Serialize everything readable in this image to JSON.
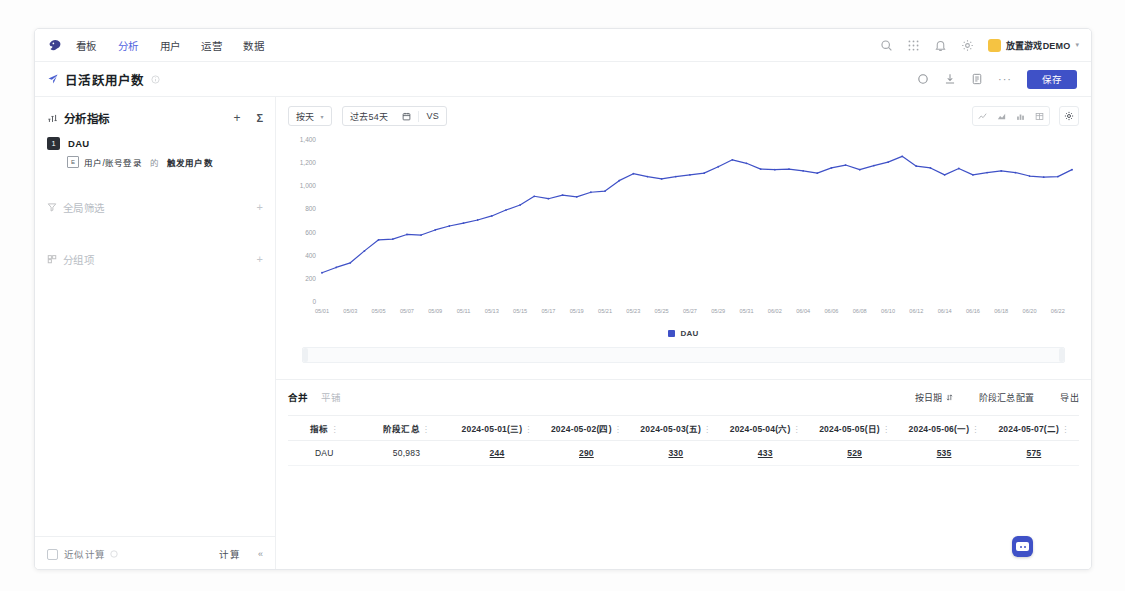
{
  "nav": {
    "logo_icon": "bird-logo-icon",
    "items": [
      {
        "label": "看板",
        "active": false
      },
      {
        "label": "分析",
        "active": true
      },
      {
        "label": "用户",
        "active": false
      },
      {
        "label": "运营",
        "active": false
      },
      {
        "label": "数据",
        "active": false
      }
    ],
    "icons": [
      "search-icon",
      "apps-grid-icon",
      "bell-icon",
      "settings-gear-icon"
    ],
    "account": {
      "name": "放置游戏DEMO",
      "caret": "▾"
    }
  },
  "titlebar": {
    "title": "日活跃用户数",
    "info_icon": "info-circle-icon",
    "actions": [
      "refresh-icon",
      "download-icon",
      "copy-icon"
    ],
    "more": "···",
    "save_label": "保存"
  },
  "left_panel": {
    "heading": "分析指标",
    "add_label": "+",
    "sigma_label": "Σ",
    "metric": {
      "index": "1",
      "name": "DAU",
      "def_icon": "E",
      "event": "用户/账号登录",
      "of": "的",
      "aggregation": "触发用户数"
    },
    "sections": [
      {
        "label": "全局筛选",
        "plus": "+"
      },
      {
        "label": "分组项",
        "plus": "+"
      }
    ],
    "footer": {
      "approx_label": "近似计算",
      "help_icon": "question-circle-icon",
      "calc_label": "计算",
      "collapse_label": "«"
    }
  },
  "toolbar": {
    "granularity": "按天",
    "granularity_caret": "▾",
    "range": "过去54天",
    "calendar_icon": "calendar-icon",
    "vs_label": "VS",
    "chart_types": [
      "line-chart-icon",
      "area-chart-icon",
      "bar-chart-icon",
      "table-icon"
    ],
    "settings_icon": "settings-gear-icon"
  },
  "chart_data": {
    "type": "line",
    "title": "日活跃用户数",
    "xlabel": "",
    "ylabel": "",
    "ylim": [
      0,
      1400
    ],
    "yticks": [
      0,
      200,
      400,
      600,
      800,
      1000,
      1200,
      1400
    ],
    "ytick_labels": [
      "0",
      "200",
      "400",
      "600",
      "800",
      "1,000",
      "1,200",
      "1,400"
    ],
    "grid": false,
    "legend_position": "bottom",
    "legend": [
      "DAU"
    ],
    "color": "#3f51c7",
    "xtick_labels": [
      "05/01",
      "05/03",
      "05/05",
      "05/07",
      "05/09",
      "05/11",
      "05/13",
      "05/15",
      "05/17",
      "05/19",
      "05/21",
      "05/23",
      "05/25",
      "05/27",
      "05/29",
      "05/31",
      "06/02",
      "06/04",
      "06/06",
      "06/08",
      "06/10",
      "06/12",
      "06/14",
      "06/16",
      "06/18",
      "06/20",
      "06/22"
    ],
    "x": [
      "05/01",
      "05/02",
      "05/03",
      "05/04",
      "05/05",
      "05/06",
      "05/07",
      "05/08",
      "05/09",
      "05/10",
      "05/11",
      "05/12",
      "05/13",
      "05/14",
      "05/15",
      "05/16",
      "05/17",
      "05/18",
      "05/19",
      "05/20",
      "05/21",
      "05/22",
      "05/23",
      "05/24",
      "05/25",
      "05/26",
      "05/27",
      "05/28",
      "05/29",
      "05/30",
      "05/31",
      "06/01",
      "06/02",
      "06/03",
      "06/04",
      "06/05",
      "06/06",
      "06/07",
      "06/08",
      "06/09",
      "06/10",
      "06/11",
      "06/12",
      "06/13",
      "06/14",
      "06/15",
      "06/16",
      "06/17",
      "06/18",
      "06/19",
      "06/20",
      "06/21",
      "06/22",
      "06/23"
    ],
    "series": [
      {
        "name": "DAU",
        "values": [
          244,
          290,
          330,
          433,
          529,
          535,
          575,
          570,
          614,
          648,
          673,
          700,
          735,
          786,
          830,
          905,
          884,
          915,
          900,
          940,
          950,
          1040,
          1100,
          1075,
          1055,
          1075,
          1090,
          1105,
          1160,
          1220,
          1190,
          1140,
          1135,
          1140,
          1125,
          1105,
          1150,
          1175,
          1135,
          1170,
          1200,
          1250,
          1165,
          1150,
          1090,
          1145,
          1090,
          1110,
          1125,
          1110,
          1080,
          1070,
          1075,
          1135
        ]
      }
    ]
  },
  "table": {
    "tabs": [
      {
        "label": "合并",
        "active": true
      },
      {
        "label": "平铺",
        "active": false
      }
    ],
    "actions": [
      {
        "label": "按日期",
        "icon": "sort-icon"
      },
      {
        "label": "阶段汇总配置",
        "icon": ""
      },
      {
        "label": "导出",
        "icon": ""
      }
    ],
    "columns": [
      "指标",
      "阶段汇总",
      "2024-05-01(三)",
      "2024-05-02(四)",
      "2024-05-03(五)",
      "2024-05-04(六)",
      "2024-05-05(日)",
      "2024-05-06(一)",
      "2024-05-07(二)"
    ],
    "rows": [
      {
        "metric": "DAU",
        "summary": "50,983",
        "values": [
          "244",
          "290",
          "330",
          "433",
          "529",
          "535",
          "575"
        ]
      }
    ]
  },
  "assistant": {
    "icon": "robot-assistant-icon"
  },
  "colors": {
    "accent": "#3f51c7",
    "nav_active": "#5264e0",
    "brand_badge": "#f5c342"
  }
}
